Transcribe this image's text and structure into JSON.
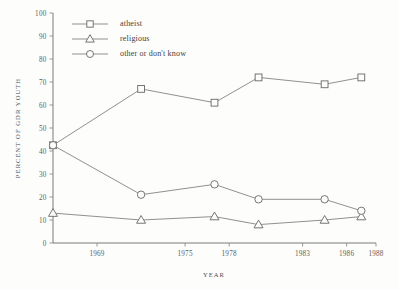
{
  "chart_data": {
    "type": "line",
    "title": "",
    "xlabel": "YEAR",
    "ylabel": "PERCENT OF GDR YOUTH",
    "xlim": [
      1966,
      1988
    ],
    "ylim": [
      0,
      100
    ],
    "yticks": [
      0,
      10,
      20,
      30,
      40,
      50,
      60,
      70,
      80,
      90,
      100
    ],
    "xticks": [
      1969,
      1975,
      1978,
      1983,
      1986,
      1988
    ],
    "xtick_labels": [
      "1969",
      "1975",
      "1978",
      "1983",
      "1986",
      "1988"
    ],
    "grid": false,
    "legend_position": "top-left-inside",
    "x": [
      1966,
      1972,
      1977,
      1980,
      1984.5,
      1987
    ],
    "series": [
      {
        "name": "atheist",
        "marker": "square",
        "values": [
          42.5,
          67,
          61,
          72,
          69,
          72
        ]
      },
      {
        "name": "religious",
        "marker": "triangle",
        "values": [
          13,
          10,
          11.5,
          8,
          10,
          11.5
        ]
      },
      {
        "name": "other or don't know",
        "marker": "circle",
        "values": [
          42.5,
          21,
          25.5,
          19,
          19,
          14
        ]
      }
    ],
    "colors": {
      "line": "#8a8a8a",
      "marker_stroke": "#6f6f6f",
      "marker_fill": "#fdfdfc",
      "axis": "#7b7b7b",
      "text": "#4f4f4f",
      "background": "#fdfdfc"
    }
  },
  "legend": {
    "entries": [
      {
        "label": "atheist",
        "marker": "square-marker"
      },
      {
        "label": "religious",
        "marker": "triangle-marker"
      },
      {
        "label": "other or don't know",
        "marker": "circle-marker"
      }
    ]
  },
  "axes": {
    "y_title": "PERCENT OF GDR YOUTH",
    "x_title": "YEAR",
    "y_labels": [
      "100",
      "90",
      "80",
      "70",
      "60",
      "50",
      "40",
      "30",
      "20",
      "10",
      "0"
    ],
    "x_labels": [
      "1969",
      "1975",
      "1978",
      "1983",
      "1986",
      "1988"
    ]
  }
}
